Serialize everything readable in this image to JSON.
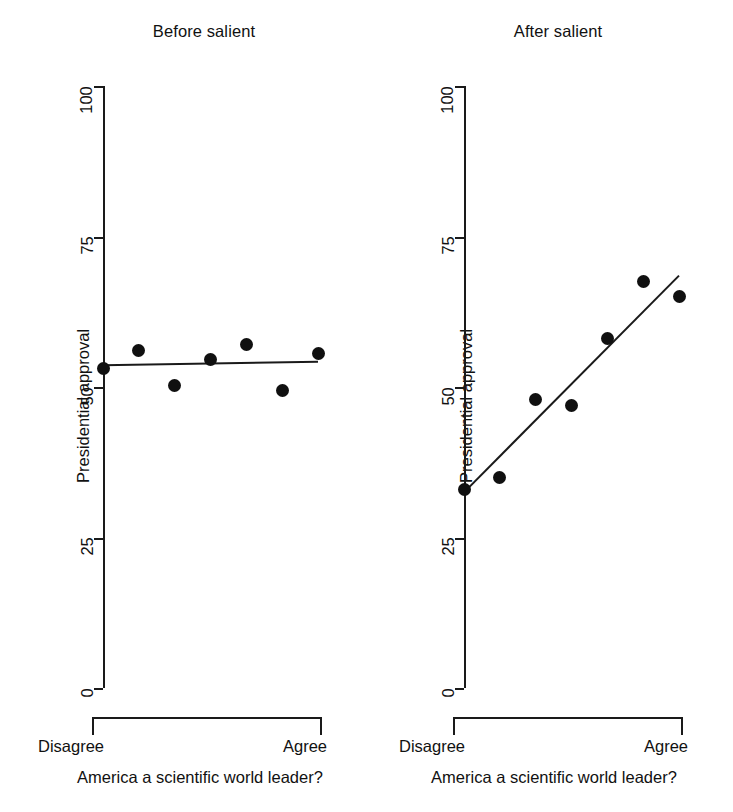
{
  "chart_data": [
    {
      "panel_id": "before",
      "type": "scatter",
      "title": "Before salient",
      "xlabel": "America a scientific world leader?",
      "ylabel": "Presidential approval",
      "ylim": [
        0,
        100
      ],
      "yticks": [
        0,
        25,
        50,
        75,
        100
      ],
      "ytick_labels": [
        "0",
        "25",
        "50",
        "75",
        "100"
      ],
      "xlim": [
        1,
        7
      ],
      "xtick_labels": [
        "Disagree",
        "Agree"
      ],
      "grid": false,
      "legend": "none",
      "x": [
        1,
        2,
        3,
        4,
        5,
        6,
        7
      ],
      "values": [
        53.0,
        56.0,
        50.3,
        54.5,
        57.0,
        49.5,
        55.5
      ],
      "fit_line": {
        "x_start": 1,
        "y_start": 53.6,
        "x_end": 7,
        "y_end": 54.2,
        "description": "flat regression line"
      }
    },
    {
      "panel_id": "after",
      "type": "scatter",
      "title": "After salient",
      "xlabel": "America a scientific world leader?",
      "ylabel": "Presidential approval",
      "ylim": [
        0,
        100
      ],
      "yticks": [
        0,
        25,
        50,
        75,
        100
      ],
      "ytick_labels": [
        "0",
        "25",
        "50",
        "75",
        "100"
      ],
      "xlim": [
        1,
        7
      ],
      "xtick_labels": [
        "Disagree",
        "Agree"
      ],
      "grid": false,
      "legend": "none",
      "x": [
        1,
        2,
        3,
        4,
        5,
        6,
        7
      ],
      "values": [
        33.0,
        35.0,
        48.0,
        47.0,
        58.0,
        67.5,
        65.0
      ],
      "fit_line": {
        "x_start": 1,
        "y_start": 32.5,
        "x_end": 7,
        "y_end": 68.5,
        "description": "upward sloping regression line"
      }
    }
  ],
  "panels": [
    {
      "title": "Before salient",
      "ylabel": "Presidential approval",
      "xlabel": "America a scientific world leader?",
      "x_low_label": "Disagree",
      "x_high_label": "Agree",
      "ytick_labels": [
        "100",
        "75",
        "50",
        "25",
        "0"
      ]
    },
    {
      "title": "After salient",
      "ylabel": "Presidential approval",
      "xlabel": "America a scientific world leader?",
      "x_low_label": "Disagree",
      "x_high_label": "Agree",
      "ytick_labels": [
        "100",
        "75",
        "50",
        "25",
        "0"
      ]
    }
  ],
  "style": {
    "ink_color": "#1a1a1a",
    "marker_color": "#101010",
    "background": "#ffffff"
  }
}
